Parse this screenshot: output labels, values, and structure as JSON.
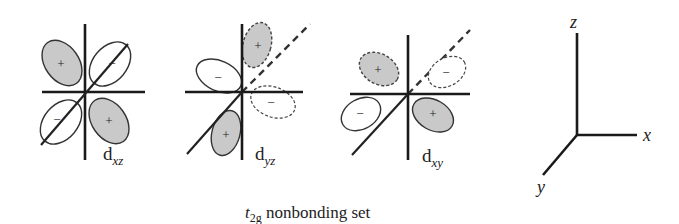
{
  "diagram": {
    "caption": {
      "symbol": "t",
      "subscript": "2g",
      "text": " nonbonding set"
    },
    "orbitals": [
      {
        "name": "dxz",
        "label_main": "d",
        "label_sub": "xz",
        "lobes": [
          {
            "sign": "+",
            "fill": "shaded",
            "outline": "solid",
            "position": "upper-left"
          },
          {
            "sign": "−",
            "fill": "white",
            "outline": "solid",
            "position": "upper-right"
          },
          {
            "sign": "−",
            "fill": "white",
            "outline": "solid",
            "position": "lower-left"
          },
          {
            "sign": "+",
            "fill": "shaded",
            "outline": "solid",
            "position": "lower-right"
          }
        ]
      },
      {
        "name": "dyz",
        "label_main": "d",
        "label_sub": "yz",
        "lobes": [
          {
            "sign": "+",
            "fill": "shaded",
            "outline": "dashed",
            "position": "upper-back"
          },
          {
            "sign": "−",
            "fill": "white",
            "outline": "solid",
            "position": "left-front"
          },
          {
            "sign": "−",
            "fill": "white",
            "outline": "dashed",
            "position": "right-back"
          },
          {
            "sign": "+",
            "fill": "shaded",
            "outline": "solid",
            "position": "lower-front"
          }
        ]
      },
      {
        "name": "dxy",
        "label_main": "d",
        "label_sub": "xy",
        "lobes": [
          {
            "sign": "+",
            "fill": "shaded",
            "outline": "dashed",
            "position": "upper-left-back"
          },
          {
            "sign": "−",
            "fill": "white",
            "outline": "dashed",
            "position": "upper-right-back"
          },
          {
            "sign": "−",
            "fill": "white",
            "outline": "solid",
            "position": "lower-left-front"
          },
          {
            "sign": "+",
            "fill": "shaded",
            "outline": "solid",
            "position": "lower-right-front"
          }
        ]
      }
    ],
    "axes": {
      "x": "x",
      "y": "y",
      "z": "z"
    },
    "colors": {
      "shaded_lobe": "#c9c9c9",
      "line": "#1a1a1a",
      "background": "#ffffff"
    }
  }
}
